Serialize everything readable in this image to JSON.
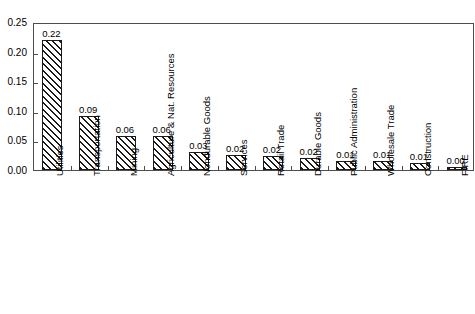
{
  "chart_data": {
    "type": "bar",
    "title": "",
    "subtitle": "",
    "xlabel": "",
    "ylabel": "",
    "ylim": [
      0.0,
      0.25
    ],
    "yticks": [
      "0.00",
      "0.05",
      "0.10",
      "0.15",
      "0.20",
      "0.25"
    ],
    "ytick_values": [
      0.0,
      0.05,
      0.1,
      0.15,
      0.2,
      0.25
    ],
    "grid": false,
    "legend": null,
    "bar_style": {
      "fill": "diagonal-hatch",
      "edge_color": "#1a1a1a",
      "face_color": "#ffffff"
    },
    "categories": [
      "Utilities",
      "Transportation",
      "Mining",
      "Agriculture & Nat. Resources",
      "Nondurable Goods",
      "Services",
      "Retail Trade",
      "Durable Goods",
      "Public Administration",
      "Wholesale Trade",
      "Construction",
      "FIRE"
    ],
    "values": [
      0.22,
      0.092,
      0.057,
      0.057,
      0.031,
      0.025,
      0.024,
      0.021,
      0.015,
      0.015,
      0.012,
      0.005
    ],
    "data_labels": [
      "0.22",
      "0.09",
      "0.06",
      "0.06",
      "0.03",
      "0.02",
      "0.02",
      "0.02",
      "0.01",
      "0.01",
      "0.01",
      "0.00"
    ]
  }
}
